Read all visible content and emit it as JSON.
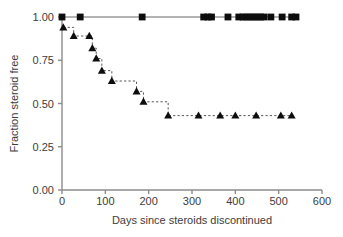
{
  "chart_data": {
    "type": "line",
    "title": "",
    "subtitle": "",
    "xlabel": "Days since steroids discontinued",
    "ylabel": "Fraction steroid free",
    "xlim": [
      0,
      600
    ],
    "ylim": [
      0.0,
      1.0
    ],
    "xticks": [
      0,
      100,
      200,
      300,
      400,
      500,
      600
    ],
    "xticklabels": [
      "0",
      "100",
      "200",
      "300",
      "400",
      "500",
      "600"
    ],
    "yticks": [
      0.0,
      0.25,
      0.5,
      0.75,
      1.0
    ],
    "yticklabels": [
      "0.00",
      "0.25",
      "0.50",
      "0.75",
      "1.00"
    ],
    "grid": false,
    "legend": null,
    "plot_kind": "kaplan-meier-step",
    "series": [
      {
        "name": "Upper group (squares)",
        "marker": "square",
        "line_style": "solid",
        "line_color": "#9a9a9a",
        "marker_color": "#0d0d0d",
        "x": [
          0,
          42,
          185,
          327,
          337,
          345,
          383,
          408,
          418,
          426,
          434,
          442,
          450,
          458,
          466,
          482,
          508,
          530,
          540
        ],
        "y": [
          1.0,
          1.0,
          1.0,
          1.0,
          1.0,
          1.0,
          1.0,
          1.0,
          1.0,
          1.0,
          1.0,
          1.0,
          1.0,
          1.0,
          1.0,
          1.0,
          1.0,
          1.0,
          1.0
        ],
        "censored_x": [
          0,
          42,
          185,
          327,
          337,
          345,
          383,
          408,
          418,
          426,
          434,
          442,
          450,
          458,
          466,
          482,
          508,
          530,
          540
        ],
        "step_points": [
          [
            0,
            1.0
          ],
          [
            540,
            1.0
          ]
        ]
      },
      {
        "name": "Lower group (triangles)",
        "marker": "triangle",
        "line_style": "dashed",
        "line_color": "#555555",
        "marker_color": "#0d0d0d",
        "x": [
          3,
          27,
          63,
          70,
          79,
          92,
          115,
          172,
          188,
          245,
          315,
          365,
          400,
          448,
          505,
          530
        ],
        "y": [
          0.94,
          0.89,
          0.89,
          0.82,
          0.76,
          0.69,
          0.63,
          0.57,
          0.51,
          0.43,
          0.43,
          0.43,
          0.43,
          0.43,
          0.43,
          0.43
        ],
        "step_points": [
          [
            3,
            0.94
          ],
          [
            27,
            0.94
          ],
          [
            27,
            0.89
          ],
          [
            63,
            0.89
          ],
          [
            63,
            0.89
          ],
          [
            70,
            0.89
          ],
          [
            70,
            0.82
          ],
          [
            79,
            0.82
          ],
          [
            79,
            0.76
          ],
          [
            92,
            0.76
          ],
          [
            92,
            0.69
          ],
          [
            115,
            0.69
          ],
          [
            115,
            0.63
          ],
          [
            172,
            0.63
          ],
          [
            172,
            0.57
          ],
          [
            188,
            0.57
          ],
          [
            188,
            0.51
          ],
          [
            245,
            0.51
          ],
          [
            245,
            0.43
          ],
          [
            530,
            0.43
          ]
        ]
      }
    ]
  },
  "axes": {
    "x_axis_name": "x-axis",
    "y_axis_name": "y-axis"
  }
}
